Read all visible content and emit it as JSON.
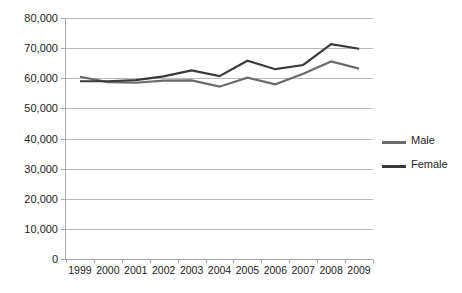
{
  "chart_data": {
    "type": "line",
    "title": "",
    "xlabel": "",
    "ylabel": "",
    "categories": [
      "1999",
      "2000",
      "2001",
      "2002",
      "2003",
      "2004",
      "2005",
      "2006",
      "2007",
      "2008",
      "2009"
    ],
    "ylim": [
      0,
      80000
    ],
    "ytick_labels": [
      "0",
      "10,000",
      "20,000",
      "30,000",
      "40,000",
      "50,000",
      "60,000",
      "70,000",
      "80,000"
    ],
    "ytick_values": [
      0,
      10000,
      20000,
      30000,
      40000,
      50000,
      60000,
      70000,
      80000
    ],
    "grid": true,
    "legend_position": "right",
    "series": [
      {
        "name": "Male",
        "color": "#6b6b6b",
        "values": [
          60500,
          58700,
          58500,
          59200,
          59300,
          57200,
          60200,
          58000,
          61500,
          65600,
          63200
        ]
      },
      {
        "name": "Female",
        "color": "#3a3a3a",
        "values": [
          59000,
          59000,
          59400,
          60600,
          62600,
          60700,
          65800,
          63000,
          64400,
          71300,
          69800
        ]
      }
    ]
  }
}
